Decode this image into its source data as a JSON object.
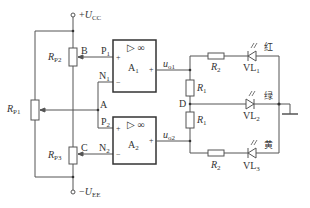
{
  "diagram": {
    "type": "circuit-schematic",
    "title": "",
    "supply": {
      "positive": {
        "sign": "+",
        "symbol": "U",
        "sub": "CC"
      },
      "negative": {
        "sign": "−",
        "symbol": "U",
        "sub": "EE"
      }
    },
    "opamps": [
      {
        "id": "A1",
        "symbol": "A",
        "sub": "1",
        "header": "▷ ∞",
        "plus_input": {
          "node": "P",
          "sub": "1"
        },
        "minus_input": {
          "node": "N",
          "sub": "1"
        },
        "output": {
          "symbol": "u",
          "sub": "o1"
        },
        "plus_sign": "+",
        "minus_sign": "−"
      },
      {
        "id": "A2",
        "symbol": "A",
        "sub": "2",
        "header": "▷ ∞",
        "plus_input": {
          "node": "P",
          "sub": "2"
        },
        "minus_input": {
          "node": "N",
          "sub": "2"
        },
        "output": {
          "symbol": "u",
          "sub": "o2"
        },
        "plus_sign": "+",
        "minus_sign": "−"
      }
    ],
    "potentiometers": [
      {
        "id": "RP1",
        "symbol": "R",
        "sub": "P1"
      },
      {
        "id": "RP2",
        "symbol": "R",
        "sub": "P2"
      },
      {
        "id": "RP3",
        "symbol": "R",
        "sub": "P3"
      }
    ],
    "resistors": [
      {
        "id": "R1_top",
        "symbol": "R",
        "sub": "1"
      },
      {
        "id": "R1_bottom",
        "symbol": "R",
        "sub": "1"
      },
      {
        "id": "R2_top",
        "symbol": "R",
        "sub": "2"
      },
      {
        "id": "R2_bottom",
        "symbol": "R",
        "sub": "2"
      }
    ],
    "leds": [
      {
        "id": "VL1",
        "label": "VL",
        "sub": "1",
        "color_label": "红"
      },
      {
        "id": "VL2",
        "label": "VL",
        "sub": "2",
        "color_label": "绿"
      },
      {
        "id": "VL3",
        "label": "VL",
        "sub": "3",
        "color_label": "黄"
      }
    ],
    "nodes": {
      "A": "A",
      "B": "B",
      "C": "C",
      "D": "D"
    },
    "ground": "ground"
  }
}
